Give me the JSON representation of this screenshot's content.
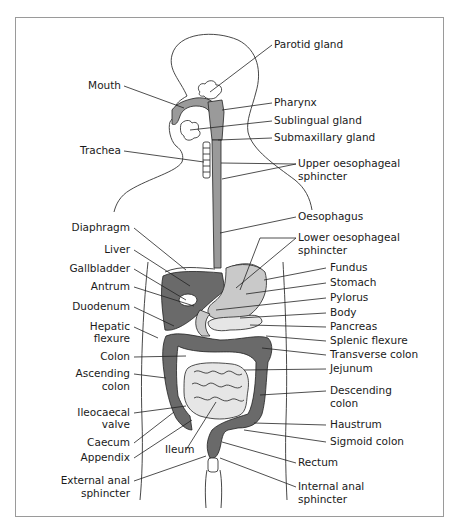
{
  "diagram": {
    "labels_left": [
      {
        "id": "mouth",
        "text": "Mouth",
        "x": 121,
        "y": 89
      },
      {
        "id": "trachea",
        "text": "Trachea",
        "x": 121,
        "y": 154
      },
      {
        "id": "diaphragm",
        "text": "Diaphragm",
        "x": 130,
        "y": 231
      },
      {
        "id": "liver",
        "text": "Liver",
        "x": 130,
        "y": 253
      },
      {
        "id": "gallbladder",
        "text": "Gallbladder",
        "x": 130,
        "y": 272
      },
      {
        "id": "antrum",
        "text": "Antrum",
        "x": 130,
        "y": 290
      },
      {
        "id": "duodenum",
        "text": "Duodenum",
        "x": 130,
        "y": 310
      },
      {
        "id": "hepatic-flexure-1",
        "text": "Hepatic",
        "x": 130,
        "y": 330
      },
      {
        "id": "hepatic-flexure-2",
        "text": "flexure",
        "x": 130,
        "y": 342
      },
      {
        "id": "colon",
        "text": "Colon",
        "x": 130,
        "y": 360
      },
      {
        "id": "ascending-colon-1",
        "text": "Ascending",
        "x": 130,
        "y": 377
      },
      {
        "id": "ascending-colon-2",
        "text": "colon",
        "x": 130,
        "y": 390
      },
      {
        "id": "ileocaecal-valve-1",
        "text": "Ileocaecal",
        "x": 130,
        "y": 416
      },
      {
        "id": "ileocaecal-valve-2",
        "text": "valve",
        "x": 130,
        "y": 428
      },
      {
        "id": "caecum",
        "text": "Caecum",
        "x": 130,
        "y": 446
      },
      {
        "id": "appendix",
        "text": "Appendix",
        "x": 130,
        "y": 461
      },
      {
        "id": "external-anal-sphincter-1",
        "text": "External anal",
        "x": 130,
        "y": 484
      },
      {
        "id": "external-anal-sphincter-2",
        "text": "sphincter",
        "x": 130,
        "y": 497
      }
    ],
    "labels_right": [
      {
        "id": "parotid-gland",
        "text": "Parotid gland",
        "x": 274,
        "y": 48
      },
      {
        "id": "pharynx",
        "text": "Pharynx",
        "x": 274,
        "y": 106
      },
      {
        "id": "sublingual-gland",
        "text": "Sublingual gland",
        "x": 274,
        "y": 124
      },
      {
        "id": "submaxillary-gland",
        "text": "Submaxillary gland",
        "x": 274,
        "y": 141
      },
      {
        "id": "upper-oesophageal-sphincter-1",
        "text": "Upper oesophageal",
        "x": 298,
        "y": 167
      },
      {
        "id": "upper-oesophageal-sphincter-2",
        "text": "sphincter",
        "x": 298,
        "y": 180
      },
      {
        "id": "oesophagus",
        "text": "Oesophagus",
        "x": 298,
        "y": 220
      },
      {
        "id": "lower-oesophageal-sphincter-1",
        "text": "Lower oesophageal",
        "x": 298,
        "y": 241
      },
      {
        "id": "lower-oesophageal-sphincter-2",
        "text": "sphincter",
        "x": 298,
        "y": 254
      },
      {
        "id": "fundus",
        "text": "Fundus",
        "x": 330,
        "y": 271
      },
      {
        "id": "stomach",
        "text": "Stomach",
        "x": 330,
        "y": 286
      },
      {
        "id": "pylorus",
        "text": "Pylorus",
        "x": 330,
        "y": 301
      },
      {
        "id": "body",
        "text": "Body",
        "x": 330,
        "y": 316
      },
      {
        "id": "pancreas",
        "text": "Pancreas",
        "x": 330,
        "y": 330
      },
      {
        "id": "splenic-flexure",
        "text": "Splenic flexure",
        "x": 330,
        "y": 344
      },
      {
        "id": "transverse-colon",
        "text": "Transverse colon",
        "x": 330,
        "y": 358
      },
      {
        "id": "jejunum",
        "text": "Jejunum",
        "x": 330,
        "y": 372
      },
      {
        "id": "descending-colon-1",
        "text": "Descending",
        "x": 330,
        "y": 394
      },
      {
        "id": "descending-colon-2",
        "text": "colon",
        "x": 330,
        "y": 407
      },
      {
        "id": "haustrum",
        "text": "Haustrum",
        "x": 330,
        "y": 428
      },
      {
        "id": "sigmoid-colon",
        "text": "Sigmoid colon",
        "x": 330,
        "y": 445
      },
      {
        "id": "rectum",
        "text": "Rectum",
        "x": 298,
        "y": 466
      },
      {
        "id": "internal-anal-sphincter-1",
        "text": "Internal anal",
        "x": 298,
        "y": 490
      },
      {
        "id": "internal-anal-sphincter-2",
        "text": "sphincter",
        "x": 298,
        "y": 503
      }
    ],
    "colors": {
      "frame": "#9a9a9a",
      "dark_organ": "#6a6a6a",
      "mid_organ": "#9a9a9a",
      "light_organ": "#c9c9c9",
      "pale_organ": "#e6e6e6"
    }
  }
}
